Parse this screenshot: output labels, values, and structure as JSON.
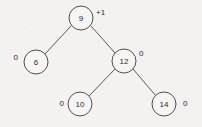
{
  "figure": {
    "kind": "binary-search-tree-diagram",
    "background_color": "#f3f2f0",
    "stroke_color": "#4f4f4f",
    "text_color": "#2b2b2b",
    "node_radius": 12
  },
  "nodes": [
    {
      "id": "n9",
      "key": "9",
      "cx": 81,
      "cy": 18,
      "balance": "+1",
      "balance_x": 96,
      "balance_y": 12,
      "balance_anchor": "start"
    },
    {
      "id": "n6",
      "key": "6",
      "cx": 36,
      "cy": 62,
      "balance": "0",
      "balance_x": 18,
      "balance_y": 57,
      "balance_anchor": "end"
    },
    {
      "id": "n12",
      "key": "12",
      "cx": 124,
      "cy": 61,
      "balance": "0",
      "balance_x": 139,
      "balance_y": 53,
      "balance_anchor": "start"
    },
    {
      "id": "n10",
      "key": "10",
      "cx": 80,
      "cy": 104,
      "balance": "0",
      "balance_x": 64,
      "balance_y": 103,
      "balance_anchor": "end"
    },
    {
      "id": "n14",
      "key": "14",
      "cx": 164,
      "cy": 104,
      "balance": "0",
      "balance_x": 183,
      "balance_y": 103,
      "balance_anchor": "start"
    }
  ],
  "edges": [
    {
      "id": "e9-6",
      "from": "n9",
      "to": "n6",
      "x1": 71,
      "y1": 26,
      "x2": 45,
      "y2": 54
    },
    {
      "id": "e9-12",
      "from": "n9",
      "to": "n12",
      "x1": 91,
      "y1": 26,
      "x2": 115,
      "y2": 53
    },
    {
      "id": "e12-10",
      "from": "n12",
      "to": "n10",
      "x1": 115,
      "y1": 69,
      "x2": 89,
      "y2": 96
    },
    {
      "id": "e12-14",
      "from": "n12",
      "to": "n14",
      "x1": 133,
      "y1": 69,
      "x2": 156,
      "y2": 96
    }
  ]
}
